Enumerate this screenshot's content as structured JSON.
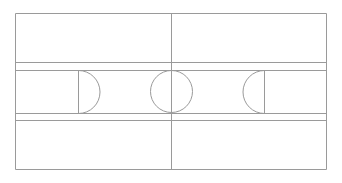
{
  "diagram": {
    "title": "Court Diagram",
    "type": "sports-court-plan",
    "sport": "basketball",
    "orientation": "landscape",
    "background_color": "#fefefe",
    "line_color": "#9a9a9a",
    "surface_color": "#ffffff",
    "line_width": 1,
    "canvas": {
      "width": 342,
      "height": 183
    },
    "geometry": {
      "boundary": {
        "name": "outer-boundary",
        "x": 15,
        "y": 13,
        "width": 312,
        "height": 157
      },
      "center_line": {
        "name": "half-court-line",
        "x": 171,
        "y1": 13,
        "y2": 170
      },
      "center_circle": {
        "name": "center-circle",
        "cx": 171,
        "cy": 91,
        "r": 21
      },
      "upper_band_line": {
        "name": "upper-sideline-band",
        "y": 62,
        "x1": 15,
        "x2": 327
      },
      "lower_band_line": {
        "name": "lower-sideline-band",
        "y": 120,
        "x1": 15,
        "x2": 327
      },
      "center_strip": {
        "name": "center-strip",
        "top": 70,
        "bottom": 113
      },
      "left_key": {
        "name": "left-goal-area",
        "x": 15,
        "y": 70,
        "width": 63,
        "height": 43,
        "free_throw_line_x": 78,
        "arc_radius": 21,
        "arc_extent_x": 99
      },
      "right_key": {
        "name": "right-goal-area",
        "x": 264,
        "y": 70,
        "width": 63,
        "height": 43,
        "free_throw_line_x": 264,
        "arc_radius": 21,
        "arc_extent_x": 243
      }
    },
    "labels": {
      "left_key": "Left goal area",
      "right_key": "Right goal area",
      "center_circle": "Center circle",
      "center_line": "Halfway line",
      "boundary": "Court boundary"
    }
  }
}
